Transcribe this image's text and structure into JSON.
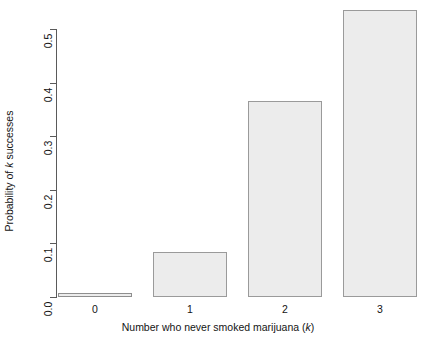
{
  "chart_data": {
    "type": "bar",
    "title": "",
    "subtitle": "",
    "xlabel_plain": "Number who never smoked marijuana (k)",
    "xlabel_prefix": "Number who never smoked marijuana (",
    "xlabel_italic": "k",
    "xlabel_suffix": ")",
    "ylabel_plain": "Probability of k successes",
    "ylabel_prefix": "Probability of ",
    "ylabel_italic": "k",
    "ylabel_suffix": " successes",
    "categories": [
      "0",
      "1",
      "2",
      "3"
    ],
    "values": [
      0.006,
      0.084,
      0.366,
      0.535
    ],
    "y_ticks": [
      "0.0",
      "0.1",
      "0.2",
      "0.3",
      "0.4",
      "0.5"
    ],
    "y_tick_values": [
      0.0,
      0.1,
      0.2,
      0.3,
      0.4,
      0.5
    ],
    "ylim": [
      0.0,
      0.55
    ],
    "grid": false,
    "legend": false,
    "legend_position": "none",
    "bar_fill_color": "#ececec",
    "bar_border_color": "#9a9a9a",
    "axis_color": "#5a5a5a",
    "text_color": "#141414",
    "background_color": "#ffffff"
  }
}
